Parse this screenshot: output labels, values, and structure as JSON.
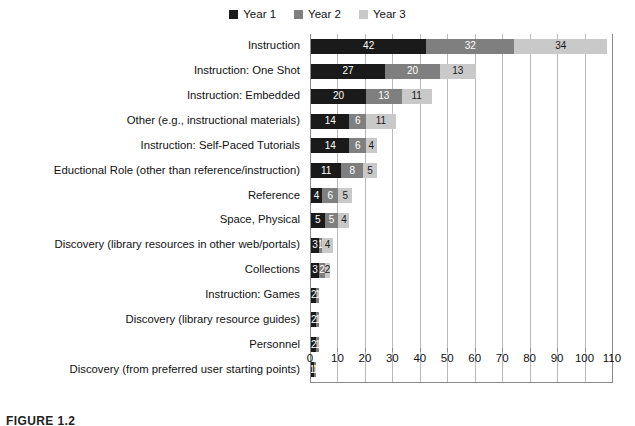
{
  "legend": {
    "position": "top-center",
    "entries": [
      {
        "label": "Year 1",
        "color": "#1a1a1a"
      },
      {
        "label": "Year 2",
        "color": "#7f7f7f"
      },
      {
        "label": "Year 3",
        "color": "#c9c9c9"
      }
    ]
  },
  "caption": {
    "text": "FIGURE 1.2"
  },
  "chart_data": {
    "type": "bar",
    "orientation": "horizontal",
    "stacked": true,
    "title": "",
    "subtitle": "",
    "xlabel": "",
    "ylabel": "",
    "xlim": [
      0,
      110
    ],
    "xticks": [
      0,
      10,
      20,
      30,
      40,
      50,
      60,
      70,
      80,
      90,
      100,
      110
    ],
    "grid": "vertical",
    "legend_position": "top-center",
    "categories": [
      "Instruction",
      "Instruction: One Shot",
      "Instruction: Embedded",
      "Other (e.g., instructional materials)",
      "Instruction: Self-Paced Tutorials",
      "Eductional Role (other than reference/instruction)",
      "Reference",
      "Space, Physical",
      "Discovery (library resources in other web/portals)",
      "Collections",
      "Instruction: Games",
      "Discovery (library resource guides)",
      "Personnel",
      "Discovery (from preferred user starting points)"
    ],
    "series": [
      {
        "name": "Year 1",
        "color": "#1a1a1a",
        "values": [
          42,
          27,
          20,
          14,
          14,
          11,
          4,
          5,
          3,
          3,
          2,
          2,
          2,
          1
        ]
      },
      {
        "name": "Year 2",
        "color": "#7f7f7f",
        "values": [
          32,
          20,
          13,
          6,
          6,
          8,
          6,
          5,
          1,
          2,
          1,
          1,
          1,
          1
        ]
      },
      {
        "name": "Year 3",
        "color": "#c9c9c9",
        "values": [
          34,
          13,
          11,
          11,
          4,
          5,
          5,
          4,
          4,
          2,
          0,
          0,
          0,
          0
        ]
      }
    ],
    "totals": [
      108,
      60,
      44,
      31,
      24,
      24,
      15,
      14,
      8,
      7,
      3,
      3,
      3,
      2
    ]
  }
}
